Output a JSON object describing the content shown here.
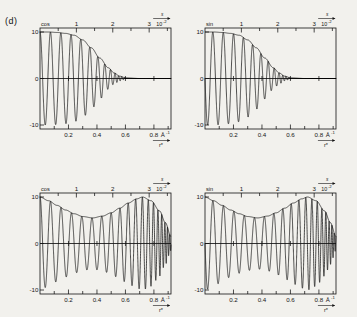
{
  "figure": {
    "panel_tag": "(d)",
    "background_hex": "#f2f1ed",
    "ink_hex": "#121212"
  },
  "axes_common": {
    "top_axis_symbol": "s",
    "top_axis_exponent_base": "10",
    "top_axis_exponent": "-2",
    "top_ticks_major": [
      "1",
      "2",
      "3"
    ],
    "top_ticks_values": [
      1,
      2,
      3
    ],
    "top_axis_range": [
      0,
      3.6
    ],
    "bottom_ticks_major": [
      "0.2",
      "0.4",
      "0.6",
      "0.8"
    ],
    "bottom_ticks_values": [
      0.2,
      0.4,
      0.6,
      0.8
    ],
    "bottom_axis_unit": "Å",
    "bottom_axis_unit_exponent": "-1",
    "bottom_axis_label": "r*",
    "bottom_axis_range": [
      0,
      0.92
    ],
    "y_ticks": [
      "10",
      "0",
      "-10"
    ],
    "y_ticks_values": [
      10,
      0,
      -10
    ],
    "y_range": [
      -11,
      11
    ]
  },
  "panels": [
    {
      "id": "top-left",
      "function_label": "cos",
      "phase": "cosine",
      "damping": "strong",
      "description": "Strongly damped cosine, amplitude decays to zero near r* = 0.58"
    },
    {
      "id": "top-right",
      "function_label": "sin",
      "phase": "sine",
      "damping": "strong",
      "description": "Strongly damped sine, amplitude decays to zero near r* = 0.58"
    },
    {
      "id": "bottom-left",
      "function_label": "cos",
      "phase": "cosine",
      "damping": "modulated",
      "description": "Chirped cosine, envelope dips to 5.5 near r* = 0.37 then returns to 10 near r* = 0.72"
    },
    {
      "id": "bottom-right",
      "function_label": "sin",
      "phase": "sine",
      "damping": "modulated",
      "description": "Chirped sine, envelope dips to 5.5 near r* = 0.37 then returns to 10 near r* = 0.72"
    }
  ],
  "chart_data": {
    "type": "line",
    "title": "",
    "xlabel": "r*",
    "ylabel": "",
    "xlim": [
      0,
      0.92
    ],
    "ylim": [
      -11,
      11
    ],
    "grid": false,
    "legend": "none",
    "x_unit": "Å^-1",
    "secondary_x_axis": {
      "label": "s",
      "scale": "10^-2",
      "lim": [
        0,
        3.6
      ],
      "ticks": [
        1,
        2,
        3
      ]
    },
    "series": [
      {
        "name": "cos strong-damped",
        "panel": "top-left",
        "model": "A(r)*cos(2*pi*r/T)",
        "envelope_points": [
          {
            "x": 0.0,
            "y": 10.0
          },
          {
            "x": 0.06,
            "y": 10.0
          },
          {
            "x": 0.12,
            "y": 9.9
          },
          {
            "x": 0.18,
            "y": 9.7
          },
          {
            "x": 0.24,
            "y": 9.3
          },
          {
            "x": 0.3,
            "y": 8.3
          },
          {
            "x": 0.36,
            "y": 6.6
          },
          {
            "x": 0.42,
            "y": 4.4
          },
          {
            "x": 0.48,
            "y": 2.3
          },
          {
            "x": 0.52,
            "y": 1.2
          },
          {
            "x": 0.56,
            "y": 0.5
          },
          {
            "x": 0.6,
            "y": 0.15
          },
          {
            "x": 0.7,
            "y": 0.0
          },
          {
            "x": 0.92,
            "y": 0.0
          }
        ],
        "period": 0.0735,
        "chirp": 0.55,
        "zero_tail_from": 0.6
      },
      {
        "name": "sin strong-damped",
        "panel": "top-right",
        "model": "A(r)*sin(2*pi*r/T)",
        "envelope_points": [
          {
            "x": 0.0,
            "y": 10.0
          },
          {
            "x": 0.06,
            "y": 10.0
          },
          {
            "x": 0.12,
            "y": 9.9
          },
          {
            "x": 0.18,
            "y": 9.7
          },
          {
            "x": 0.24,
            "y": 9.3
          },
          {
            "x": 0.3,
            "y": 8.3
          },
          {
            "x": 0.36,
            "y": 6.6
          },
          {
            "x": 0.42,
            "y": 4.4
          },
          {
            "x": 0.48,
            "y": 2.3
          },
          {
            "x": 0.52,
            "y": 1.2
          },
          {
            "x": 0.56,
            "y": 0.5
          },
          {
            "x": 0.6,
            "y": 0.15
          },
          {
            "x": 0.7,
            "y": 0.0
          },
          {
            "x": 0.92,
            "y": 0.0
          }
        ],
        "period": 0.0735,
        "chirp": 0.55,
        "zero_tail_from": 0.6
      },
      {
        "name": "cos modulated",
        "panel": "bottom-left",
        "model": "A(r)*cos(phase(r))",
        "envelope_points": [
          {
            "x": 0.0,
            "y": 10.0
          },
          {
            "x": 0.06,
            "y": 9.2
          },
          {
            "x": 0.12,
            "y": 8.2
          },
          {
            "x": 0.18,
            "y": 7.2
          },
          {
            "x": 0.24,
            "y": 6.4
          },
          {
            "x": 0.3,
            "y": 5.8
          },
          {
            "x": 0.37,
            "y": 5.5
          },
          {
            "x": 0.44,
            "y": 5.9
          },
          {
            "x": 0.5,
            "y": 6.6
          },
          {
            "x": 0.56,
            "y": 7.6
          },
          {
            "x": 0.62,
            "y": 8.7
          },
          {
            "x": 0.68,
            "y": 9.6
          },
          {
            "x": 0.72,
            "y": 10.0
          },
          {
            "x": 0.78,
            "y": 9.2
          },
          {
            "x": 0.84,
            "y": 7.0
          },
          {
            "x": 0.88,
            "y": 4.5
          },
          {
            "x": 0.92,
            "y": 1.5
          }
        ],
        "period_start": 0.074,
        "period_end": 0.012,
        "chirp": "increasing frequency toward right edge"
      },
      {
        "name": "sin modulated",
        "panel": "bottom-right",
        "model": "A(r)*sin(phase(r))",
        "envelope_points": [
          {
            "x": 0.0,
            "y": 10.0
          },
          {
            "x": 0.06,
            "y": 9.2
          },
          {
            "x": 0.12,
            "y": 8.2
          },
          {
            "x": 0.18,
            "y": 7.2
          },
          {
            "x": 0.24,
            "y": 6.4
          },
          {
            "x": 0.3,
            "y": 5.8
          },
          {
            "x": 0.37,
            "y": 5.5
          },
          {
            "x": 0.44,
            "y": 5.9
          },
          {
            "x": 0.5,
            "y": 6.6
          },
          {
            "x": 0.56,
            "y": 7.6
          },
          {
            "x": 0.62,
            "y": 8.7
          },
          {
            "x": 0.68,
            "y": 9.6
          },
          {
            "x": 0.72,
            "y": 10.0
          },
          {
            "x": 0.78,
            "y": 9.2
          },
          {
            "x": 0.84,
            "y": 7.0
          },
          {
            "x": 0.88,
            "y": 4.5
          },
          {
            "x": 0.92,
            "y": 1.5
          }
        ],
        "period_start": 0.074,
        "period_end": 0.012,
        "chirp": "increasing frequency toward right edge"
      }
    ]
  }
}
